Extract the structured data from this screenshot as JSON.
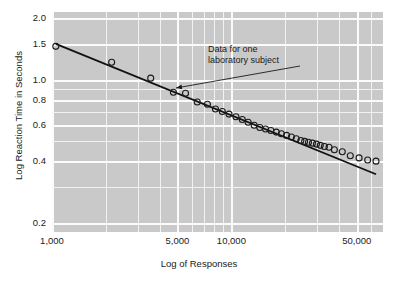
{
  "chart_data": {
    "type": "scatter",
    "title": "",
    "xlabel": "Log of Responses",
    "ylabel": "Log Reaction Time in Seconds",
    "xscale": "log",
    "yscale": "log",
    "xlim": [
      1000,
      70000
    ],
    "ylim": [
      0.18,
      2.15
    ],
    "grid": true,
    "legend": null,
    "xticks": [
      {
        "value": 1000,
        "label": "1,000"
      },
      {
        "value": 5000,
        "label": "5,000"
      },
      {
        "value": 10000,
        "label": "10,000"
      },
      {
        "value": 50000,
        "label": "50,000"
      }
    ],
    "xminor": [
      2000,
      3000,
      4000,
      6000,
      7000,
      8000,
      9000,
      20000,
      30000,
      40000,
      60000,
      70000
    ],
    "yticks": [
      {
        "value": 2.0,
        "label": "2.0"
      },
      {
        "value": 1.5,
        "label": "1.5"
      },
      {
        "value": 1.0,
        "label": "1.0"
      },
      {
        "value": 0.8,
        "label": "0.8"
      },
      {
        "value": 0.6,
        "label": "0.6"
      },
      {
        "value": 0.4,
        "label": "0.4"
      },
      {
        "value": 0.2,
        "label": "0.2"
      }
    ],
    "yminor": [
      0.9,
      0.7,
      0.5,
      0.3
    ],
    "series": [
      {
        "name": "Data for one laboratory subject",
        "marker": "open-circle",
        "marker_color": "#1a1a1a",
        "points": [
          [
            1050,
            1.46
          ],
          [
            2150,
            1.22
          ],
          [
            3550,
            1.02
          ],
          [
            4750,
            0.87
          ],
          [
            5550,
            0.86
          ],
          [
            6450,
            0.78
          ],
          [
            7350,
            0.76
          ],
          [
            8150,
            0.72
          ],
          [
            8900,
            0.7
          ],
          [
            9700,
            0.68
          ],
          [
            10600,
            0.66
          ],
          [
            11500,
            0.64
          ],
          [
            12400,
            0.62
          ],
          [
            13400,
            0.6
          ],
          [
            14400,
            0.585
          ],
          [
            15500,
            0.575
          ],
          [
            16600,
            0.565
          ],
          [
            17800,
            0.555
          ],
          [
            19000,
            0.545
          ],
          [
            20300,
            0.535
          ],
          [
            21600,
            0.525
          ],
          [
            23000,
            0.515
          ],
          [
            24400,
            0.505
          ],
          [
            25600,
            0.5
          ],
          [
            26900,
            0.495
          ],
          [
            28300,
            0.49
          ],
          [
            29800,
            0.485
          ],
          [
            31300,
            0.478
          ],
          [
            33000,
            0.472
          ],
          [
            35000,
            0.468
          ],
          [
            37500,
            0.455
          ],
          [
            41500,
            0.445
          ],
          [
            46000,
            0.425
          ],
          [
            51500,
            0.415
          ],
          [
            57500,
            0.405
          ],
          [
            64000,
            0.4
          ]
        ]
      }
    ],
    "fit_line": {
      "name": "fitted power law",
      "color": "#111111",
      "x_start": 1050,
      "y_start": 1.5,
      "x_end": 64000,
      "y_end": 0.345
    },
    "annotations": [
      {
        "name": "data-callout",
        "text_line1": "Data for one",
        "text_line2": "laboratory subject",
        "arrow_from": [
          300,
          66
        ],
        "arrow_to": [
          176,
          88
        ]
      }
    ]
  },
  "colors": {
    "plot_background": "#c9c9c9",
    "page_background": "#ffffff",
    "gridline": "#f2f2f2",
    "gridline_major": "#fbfbfb",
    "ink": "#1a1a1a"
  }
}
